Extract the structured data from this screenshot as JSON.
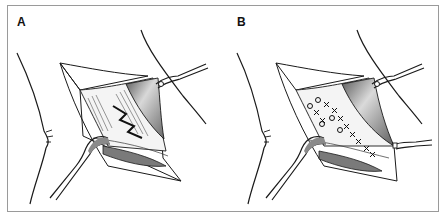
{
  "figure": {
    "panels": [
      {
        "label": "A",
        "description": "Surgical exposure with retractors; open wound showing muscle layers and a tear/defect"
      },
      {
        "label": "B",
        "description": "Same exposure with interrupted figure-of-eight (X) sutures closing the defect; second retractor added"
      }
    ],
    "colors": {
      "line": "#1a1a1a",
      "shade_dark": "#6e6e6e",
      "shade_mid": "#a8a8a8",
      "frame": "#9a9a9a",
      "background": "#ffffff"
    }
  }
}
